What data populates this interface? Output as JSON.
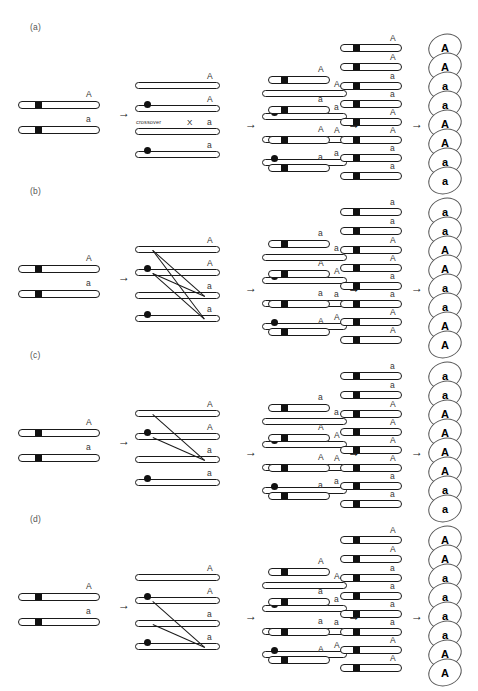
{
  "figure": {
    "type": "diagram",
    "allele_dominant": "A",
    "allele_recessive": "a",
    "crossover_label": "crossover",
    "crossover_mark": "X",
    "arrow_glyph": "→",
    "colors": {
      "line": "#1a1a1a",
      "centromere": "#111111",
      "text": "#333333",
      "spore_outline": "#555555"
    }
  },
  "panels": [
    {
      "label": "(a)",
      "stage1": [
        "A",
        "a"
      ],
      "stage2": {
        "alleles": [
          "A",
          "A",
          "a",
          "a"
        ],
        "show_crossover_label": true,
        "crossings": []
      },
      "stage3": [
        "A",
        "a",
        "A",
        "a"
      ],
      "stage4": [
        "A",
        "a",
        "A",
        "a"
      ],
      "stage5": [
        "A",
        "A",
        "a",
        "a",
        "A",
        "A",
        "a",
        "a"
      ],
      "ascus": [
        "A",
        "A",
        "a",
        "a",
        "A",
        "A",
        "a",
        "a"
      ]
    },
    {
      "label": "(b)",
      "stage1": [
        "A",
        "a"
      ],
      "stage2": {
        "alleles": [
          "A",
          "A",
          "a",
          "a"
        ],
        "show_crossover_label": false,
        "crossings": [
          [
            1,
            4
          ],
          [
            2,
            3
          ],
          [
            1,
            3
          ],
          [
            2,
            4
          ]
        ]
      },
      "stage3": [
        "a",
        "A",
        "a",
        "A"
      ],
      "stage4": [
        "a",
        "A",
        "a",
        "A"
      ],
      "stage5": [
        "a",
        "a",
        "A",
        "A",
        "a",
        "a",
        "A",
        "A"
      ],
      "ascus": [
        "a",
        "a",
        "A",
        "A",
        "a",
        "a",
        "A",
        "A"
      ]
    },
    {
      "label": "(c)",
      "stage1": [
        "A",
        "a"
      ],
      "stage2": {
        "alleles": [
          "A",
          "A",
          "a",
          "a"
        ],
        "show_crossover_label": false,
        "crossings": [
          [
            1,
            3
          ],
          [
            2,
            3
          ]
        ]
      },
      "stage3": [
        "a",
        "A",
        "A",
        "a"
      ],
      "stage4": [
        "a",
        "A",
        "A",
        "a"
      ],
      "stage5": [
        "a",
        "a",
        "A",
        "A",
        "A",
        "A",
        "a",
        "a"
      ],
      "ascus": [
        "a",
        "a",
        "A",
        "A",
        "A",
        "A",
        "a",
        "a"
      ]
    },
    {
      "label": "(d)",
      "stage1": [
        "A",
        "a"
      ],
      "stage2": {
        "alleles": [
          "A",
          "A",
          "a",
          "a"
        ],
        "show_crossover_label": false,
        "crossings": [
          [
            2,
            4
          ],
          [
            3,
            4
          ]
        ]
      },
      "stage3": [
        "A",
        "a",
        "a",
        "A"
      ],
      "stage4": [
        "A",
        "a",
        "a",
        "A"
      ],
      "stage5": [
        "A",
        "A",
        "a",
        "a",
        "a",
        "a",
        "A",
        "A"
      ],
      "ascus": [
        "A",
        "A",
        "a",
        "a",
        "a",
        "a",
        "A",
        "A"
      ]
    }
  ]
}
